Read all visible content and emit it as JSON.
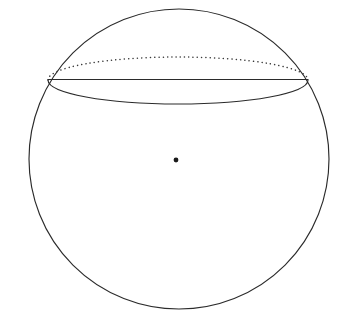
{
  "figure": {
    "background_color": "#ffffff",
    "stroke_color": "#2b2b2b",
    "dotted_stroke_color": "#3a3a3a",
    "center_dot_color": "#1a1a1a",
    "canvas": {
      "width": 349,
      "height": 323
    }
  },
  "chart_data": {
    "type": "diagram",
    "xlabel": "",
    "ylabel": "",
    "elements": [
      {
        "name": "sphere-outline",
        "shape": "circle",
        "cx": 179,
        "cy": 159,
        "r": 150,
        "stroke": "#2b2b2b",
        "style": "solid",
        "fill": "none"
      },
      {
        "name": "cross-section-front-arc",
        "shape": "elliptical-arc",
        "cx": 178,
        "cy": 80,
        "rx": 130,
        "ry": 24,
        "arc_half": "bottom",
        "stroke": "#2b2b2b",
        "style": "solid"
      },
      {
        "name": "cross-section-back-arc",
        "shape": "elliptical-arc",
        "cx": 178,
        "cy": 80,
        "rx": 130,
        "ry": 23,
        "arc_half": "top",
        "stroke": "#3a3a3a",
        "style": "dotted"
      },
      {
        "name": "cross-section-chord",
        "shape": "line",
        "x1": 48,
        "y1": 80,
        "x2": 308,
        "y2": 80,
        "stroke": "#2b2b2b",
        "style": "solid"
      },
      {
        "name": "sphere-center-point",
        "shape": "dot",
        "cx": 176,
        "cy": 160,
        "r": 2.4,
        "fill": "#1a1a1a"
      }
    ],
    "annotations": [],
    "legend": [],
    "grid": false
  }
}
